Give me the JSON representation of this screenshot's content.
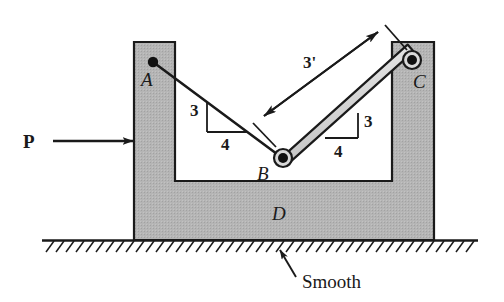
{
  "figure": {
    "labels": {
      "point_a": "A",
      "point_b": "B",
      "point_c": "C",
      "block": "D",
      "force": "P",
      "length_bc": "3'",
      "ground_note": "Smooth"
    },
    "slope_triangle_left": {
      "rise": "3",
      "run": "4"
    },
    "slope_triangle_right": {
      "rise": "3",
      "run": "4"
    },
    "colors": {
      "block_fill": "#b3b3b3",
      "block_edge": "#1a1a1a",
      "rod_fill": "#d9d9d9",
      "rod_edge": "#1a1a1a",
      "line": "#1a1a1a",
      "cavity_fill": "#ffffff",
      "background": "#ffffff"
    }
  }
}
